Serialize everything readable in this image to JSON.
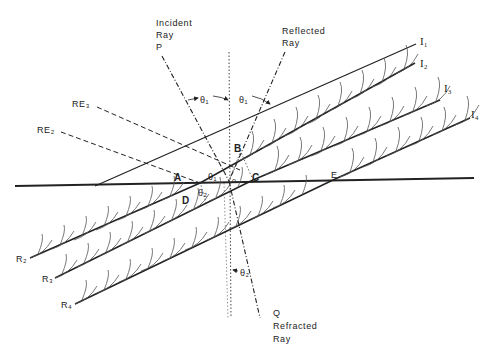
{
  "diagram": {
    "type": "refraction-reflection-wavefront-diagram",
    "rays": {
      "incident": {
        "line1": "Incident",
        "line2": "Ray",
        "line3": "P"
      },
      "reflected": {
        "line1": "Reflected",
        "line2": "Ray"
      },
      "refracted": {
        "line0": "Q",
        "line1": "Refracted",
        "line2": "Ray"
      }
    },
    "angles": {
      "theta1_left": "θ₁",
      "theta1_right": "θ₁",
      "theta1_lower": "θ₁",
      "theta2_upper": "θ₂",
      "theta2_lower": "θ₂",
      "origin_mark": "o"
    },
    "points": {
      "A": "A",
      "B": "B",
      "C": "C",
      "D": "D",
      "E": "E"
    },
    "reflected_edges": {
      "re2": "RE₂",
      "re3": "RE₃"
    },
    "incident_wavefronts": [
      "I₁",
      "I₂",
      "I₃",
      "I₄"
    ],
    "refracted_wavefronts": [
      "R₂",
      "R₃",
      "R₄"
    ],
    "colors": {
      "line": "#222222",
      "background": "#ffffff"
    }
  }
}
